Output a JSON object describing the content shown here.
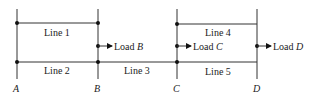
{
  "diagram": {
    "nodes": [
      {
        "id": "A",
        "label": "A"
      },
      {
        "id": "B",
        "label": "B"
      },
      {
        "id": "C",
        "label": "C"
      },
      {
        "id": "D",
        "label": "D"
      }
    ],
    "lines": [
      {
        "id": "line1",
        "label": "Line 1",
        "from": "A",
        "to": "B",
        "level": "upper"
      },
      {
        "id": "line2",
        "label": "Line 2",
        "from": "A",
        "to": "B",
        "level": "lower"
      },
      {
        "id": "line3",
        "label": "Line 3",
        "from": "B",
        "to": "C",
        "level": "lower"
      },
      {
        "id": "line4",
        "label": "Line 4",
        "from": "C",
        "to": "D",
        "level": "upper"
      },
      {
        "id": "line5",
        "label": "Line 5",
        "from": "C",
        "to": "D",
        "level": "lower"
      }
    ],
    "loads": [
      {
        "id": "loadB",
        "prefix": "Load ",
        "bus": "B"
      },
      {
        "id": "loadC",
        "prefix": "Load ",
        "bus": "C"
      },
      {
        "id": "loadD",
        "prefix": "Load ",
        "bus": "D"
      }
    ]
  }
}
